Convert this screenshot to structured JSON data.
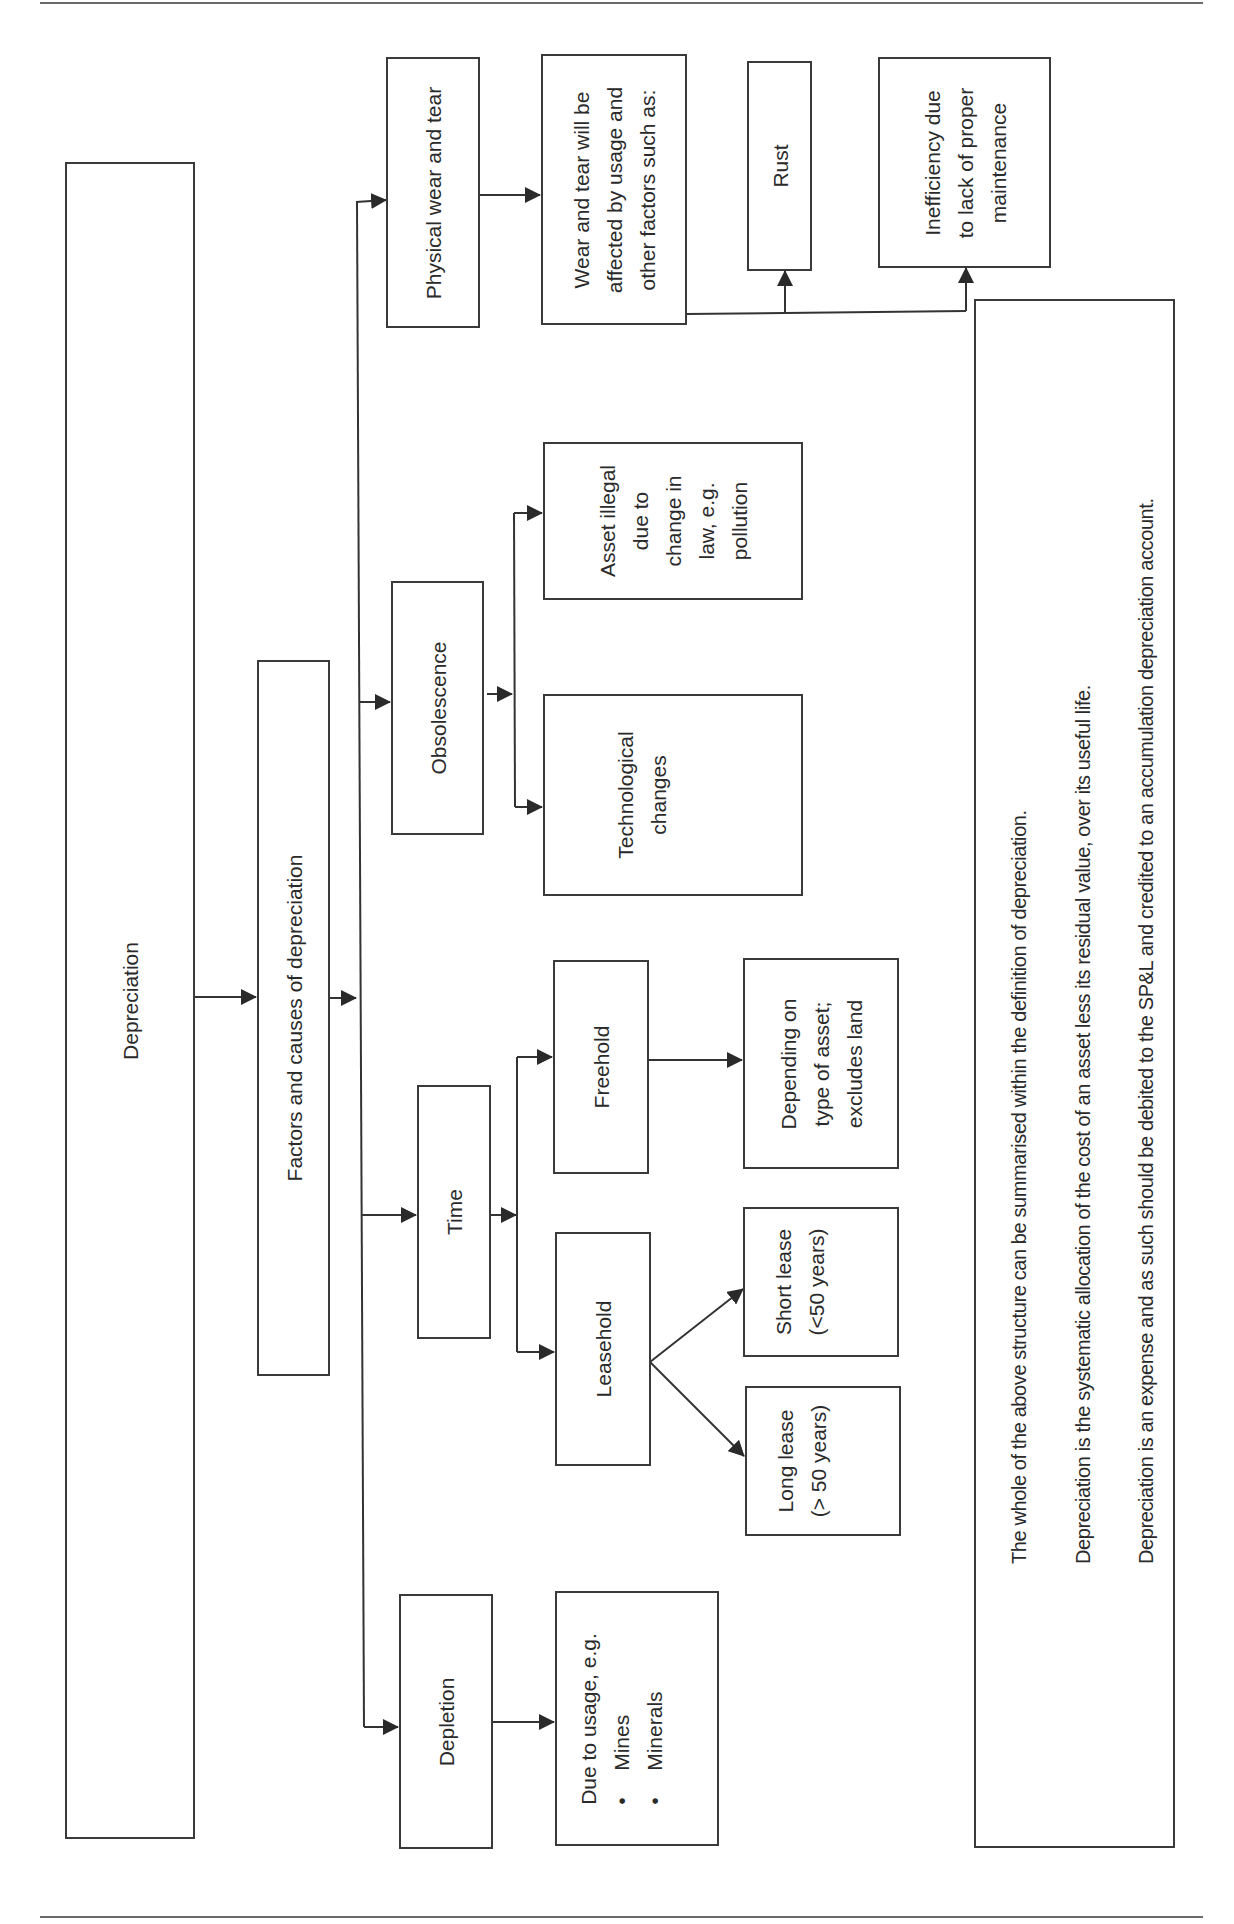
{
  "diagram": {
    "title": "Depreciation",
    "root": {
      "label": "Depreciation"
    },
    "factors": {
      "label": "Factors and causes of depreciation"
    },
    "categories": {
      "physical": {
        "label": "Physical wear and tear",
        "detail": {
          "lines": [
            "Wear and tear will be",
            "affected by usage and",
            "other factors such as:"
          ]
        },
        "examples": [
          {
            "lines": [
              "Rust"
            ]
          },
          {
            "lines": [
              "Inefficiency due",
              "to lack of proper",
              "maintenance"
            ]
          }
        ]
      },
      "obsolescence": {
        "label": "Obsolescence",
        "children": [
          {
            "lines": [
              "Asset illegal",
              "due to",
              "change in",
              "law, e.g.",
              "pollution"
            ]
          },
          {
            "lines": [
              "Technological",
              "changes"
            ]
          }
        ]
      },
      "time": {
        "label": "Time",
        "freehold": {
          "label": "Freehold",
          "detail": {
            "lines": [
              "Depending on",
              "type of asset;",
              "excludes land"
            ]
          }
        },
        "leasehold": {
          "label": "Leasehold",
          "short": {
            "lines": [
              "Short lease",
              "(<50 years)"
            ]
          },
          "long": {
            "lines": [
              "Long lease",
              "(> 50 years)"
            ]
          }
        }
      },
      "depletion": {
        "label": "Depletion",
        "detail": {
          "intro": "Due to usage, e.g.",
          "bullets": [
            "Mines",
            "Minerals"
          ]
        }
      }
    },
    "summary": {
      "lines": [
        "The whole of the above structure can be summarised within the definition of depreciation.",
        "Depreciation is the systematic allocation of the cost of an asset less its residual value, over its useful life.",
        "Depreciation is an expense and as such should be debited to the  SP&L and credited to an accumulation depreciation account."
      ]
    },
    "colors": {
      "line": "#3a3a3a",
      "text": "#2a2a2a",
      "rule": "#6a6a6a",
      "background": "#ffffff"
    }
  }
}
